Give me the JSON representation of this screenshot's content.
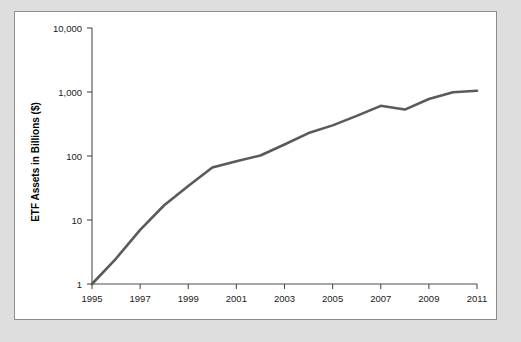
{
  "chart_data": {
    "type": "line",
    "title": "",
    "xlabel": "",
    "ylabel": "ETF Assets in Billions ($)",
    "yscale": "log",
    "ylim": [
      1,
      10000
    ],
    "xlim": [
      1995,
      2011
    ],
    "grid": false,
    "legend": false,
    "y_tick_labels": [
      "10,000",
      "1,000",
      "100",
      "10",
      "1"
    ],
    "y_tick_values": [
      10000,
      1000,
      100,
      10,
      1
    ],
    "x_tick_labels": [
      "1995",
      "1997",
      "1999",
      "2001",
      "2003",
      "2005",
      "2007",
      "2009",
      "2011"
    ],
    "x_tick_values": [
      1995,
      1997,
      1999,
      2001,
      2003,
      2005,
      2007,
      2009,
      2011
    ],
    "series": [
      {
        "name": "ETF Assets",
        "x": [
          1995,
          1996,
          1997,
          1998,
          1999,
          2000,
          2001,
          2002,
          2003,
          2004,
          2005,
          2006,
          2007,
          2008,
          2009,
          2010,
          2011
        ],
        "values": [
          1,
          2.5,
          7,
          17,
          34,
          66,
          83,
          102,
          151,
          228,
          301,
          423,
          608,
          531,
          777,
          992,
          1048
        ]
      }
    ],
    "line_color": "#5a5a5a",
    "panel_background": "#ffffff",
    "page_background": "#dedede",
    "border_color": "#8c8c8c"
  }
}
